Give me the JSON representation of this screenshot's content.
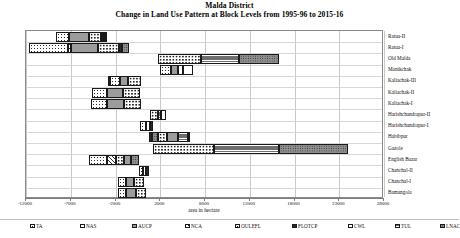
{
  "chart_data": {
    "type": "bar",
    "orientation": "horizontal",
    "stacked": true,
    "title": "Malda District",
    "subtitle": "Change in Land Use Pattern at Block Levels from 1995-96 to 2015-16",
    "xlabel": "area in hectare",
    "ylabel": "",
    "xlim": [
      -12000,
      28000
    ],
    "xticks": [
      -12000,
      -7000,
      -2000,
      3000,
      8000,
      13000,
      18000,
      23000,
      28000
    ],
    "xtick_labels": [
      "-12000",
      "-7000",
      "-2000",
      "3000",
      "8000",
      "13000",
      "18000",
      "23000",
      "28000"
    ],
    "grid": true,
    "legend_position": "bottom",
    "categories": [
      "Ratua-II",
      "Ratua-I",
      "Old Malda",
      "Manikchak",
      "Kaliachak-III",
      "Kaliachak-II",
      "Kaliachak-I",
      "Harishchandrapur-II",
      "Harishchandrapur-I",
      "Habibpur",
      "Gazole",
      "English Bazar",
      "Chanchal-II",
      "Chanchal-I",
      "Bamangola"
    ],
    "series": [
      {
        "name": "TA",
        "values": [
          1200,
          4300,
          2000,
          1000,
          800,
          1400,
          1500,
          500,
          400,
          700,
          2200,
          2000,
          900,
          900,
          900
        ]
      },
      {
        "name": "NAS",
        "values": [
          600,
          200,
          500,
          400,
          300,
          500,
          600,
          200,
          200,
          300,
          600,
          900,
          400,
          400,
          400
        ]
      },
      {
        "name": "AUCP",
        "values": [
          1700,
          2600,
          1600,
          500,
          500,
          1000,
          1100,
          200,
          200,
          700,
          1800,
          1000,
          500,
          500,
          500
        ]
      },
      {
        "name": "NCA",
        "values": [
          300,
          300,
          300,
          200,
          200,
          300,
          300,
          200,
          200,
          300,
          300,
          900,
          200,
          200,
          200
        ]
      },
      {
        "name": "OULEFL",
        "values": [
          1500,
          2000,
          3100,
          800,
          700,
          1200,
          1200,
          500,
          400,
          700,
          4600,
          700,
          800,
          800,
          800
        ]
      },
      {
        "name": "FLOTCP",
        "values": [
          200,
          150,
          150,
          100,
          100,
          150,
          150,
          100,
          100,
          400,
          200,
          300,
          100,
          100,
          100
        ]
      },
      {
        "name": "CWL",
        "values": [
          150,
          150,
          150,
          100,
          100,
          150,
          150,
          100,
          100,
          150,
          150,
          150,
          100,
          100,
          100
        ]
      },
      {
        "name": "TUL",
        "values": [
          400,
          900,
          4000,
          200,
          200,
          400,
          400,
          150,
          150,
          400,
          6800,
          400,
          200,
          200,
          200
        ]
      },
      {
        "name": "LNAC",
        "values": [
          200,
          600,
          3400,
          200,
          200,
          300,
          300,
          150,
          150,
          300,
          7600,
          300,
          200,
          200,
          200
        ]
      }
    ],
    "bar_spans_px": [
      {
        "category": "Ratua-II",
        "start": -8600,
        "segments": [
          [
            "TA",
            1450
          ],
          [
            "AUCP",
            2150
          ],
          [
            "OULEFL",
            1400
          ],
          [
            "FLOTCP",
            250
          ],
          [
            "CWL",
            200
          ],
          [
            "TUL",
            250
          ]
        ]
      },
      {
        "category": "Ratua-I",
        "start": -11700,
        "segments": [
          [
            "TA",
            4400
          ],
          [
            "NCA",
            350
          ],
          [
            "AUCP",
            3050
          ],
          [
            "OULEFL",
            2300
          ],
          [
            "FLOTCP",
            300
          ],
          [
            "LNAC",
            800
          ]
        ]
      },
      {
        "category": "Old Malda",
        "start": 2800,
        "segments": [
          [
            "OULEFL",
            4800
          ],
          [
            "TUL",
            4250
          ],
          [
            "LNAC",
            4400
          ]
        ]
      },
      {
        "category": "Manikchak",
        "start": 3000,
        "segments": [
          [
            "TA",
            1200
          ],
          [
            "AUCP",
            800
          ],
          [
            "CWL",
            500
          ],
          [
            "NAS",
            1200
          ]
        ]
      },
      {
        "category": "Kaliachak-III",
        "start": -2850,
        "segments": [
          [
            "FLOTCP",
            250
          ],
          [
            "TA",
            1100
          ],
          [
            "AUCP",
            950
          ],
          [
            "OULEFL",
            1350
          ]
        ]
      },
      {
        "category": "Kaliachak-II",
        "start": -4600,
        "segments": [
          [
            "TA",
            1700
          ],
          [
            "AUCP",
            1700
          ],
          [
            "OULEFL",
            1900
          ]
        ]
      },
      {
        "category": "Kaliachak-I",
        "start": -4700,
        "segments": [
          [
            "TA",
            1700
          ],
          [
            "AUCP",
            1900
          ],
          [
            "OULEFL",
            1900
          ]
        ]
      },
      {
        "category": "Harishchandrapur-II",
        "start": 1900,
        "segments": [
          [
            "OULEFL",
            900
          ],
          [
            "TUL",
            300
          ],
          [
            "CWL",
            500
          ]
        ]
      },
      {
        "category": "Harishchandrapur-I",
        "start": 700,
        "segments": [
          [
            "TA",
            700
          ],
          [
            "CWL",
            400
          ],
          [
            "FLOTCP",
            350
          ]
        ]
      },
      {
        "category": "Habibpur",
        "start": 1700,
        "segments": [
          [
            "FLOTCP",
            400
          ],
          [
            "LNAC",
            700
          ],
          [
            "OULEFL",
            900
          ],
          [
            "AUCP",
            1300
          ],
          [
            "TUL",
            1100
          ],
          [
            "NCA",
            250
          ]
        ]
      },
      {
        "category": "Gazole",
        "start": 2150,
        "segments": [
          [
            "OULEFL",
            6900
          ],
          [
            "TUL",
            7200
          ],
          [
            "LNAC",
            7700
          ]
        ]
      },
      {
        "category": "English Bazar",
        "start": -5000,
        "segments": [
          [
            "TA",
            2100
          ],
          [
            "NCA",
            1000
          ],
          [
            "OULEFL",
            900
          ],
          [
            "AUCP",
            700
          ],
          [
            "LNAC",
            900
          ]
        ]
      },
      {
        "category": "Chanchal-II",
        "start": 600,
        "segments": [
          [
            "TA",
            500
          ],
          [
            "CWL",
            300
          ],
          [
            "FLOTCP",
            300
          ]
        ]
      },
      {
        "category": "Chanchal-I",
        "start": -1700,
        "segments": [
          [
            "TA",
            900
          ],
          [
            "AUCP",
            900
          ],
          [
            "OULEFL",
            1100
          ]
        ]
      },
      {
        "category": "Bamangola",
        "start": -1700,
        "segments": [
          [
            "TA",
            900
          ],
          [
            "AUCP",
            1100
          ],
          [
            "OULEFL",
            1100
          ]
        ]
      }
    ]
  },
  "legend": {
    "items": [
      {
        "label": "TA",
        "pattern": "p-TA"
      },
      {
        "label": "NAS",
        "pattern": "p-NAS"
      },
      {
        "label": "AUCP",
        "pattern": "p-AUCP"
      },
      {
        "label": "NCA",
        "pattern": "p-NCA"
      },
      {
        "label": "OULEFL",
        "pattern": "p-OULEFL"
      },
      {
        "label": "FLOTCP",
        "pattern": "p-FLOTCP"
      },
      {
        "label": "CWL",
        "pattern": "p-CWL"
      },
      {
        "label": "TUL",
        "pattern": "p-TUL"
      },
      {
        "label": "LNAC",
        "pattern": "p-LNAC"
      }
    ],
    "x_positions": [
      0,
      50,
      102,
      155,
      205,
      262,
      318,
      365,
      410
    ]
  },
  "colors": {
    "axis": "#7d7d7d",
    "grid": "#c9c9c9",
    "border": "#8a8a8a",
    "text": "#111111",
    "bar_outline": "#1a1a1a"
  }
}
